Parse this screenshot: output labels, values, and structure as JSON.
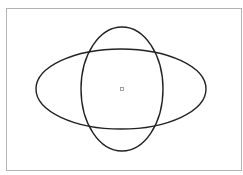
{
  "diagram": {
    "title": "",
    "frame": {
      "x": 6,
      "y": 8,
      "w": 235,
      "h": 162,
      "stroke": "#b4b4b4"
    },
    "shapes": [
      {
        "type": "ellipse",
        "name": "horizontal-ellipse",
        "cx": 121,
        "cy": 89,
        "rx": 85,
        "ry": 40,
        "stroke": "#222222"
      },
      {
        "type": "ellipse",
        "name": "vertical-ellipse",
        "cx": 122,
        "cy": 89,
        "rx": 41,
        "ry": 62,
        "stroke": "#222222"
      }
    ],
    "center_marker": {
      "x": 120,
      "y": 87,
      "size": 3,
      "stroke": "#8a8a8a"
    }
  }
}
